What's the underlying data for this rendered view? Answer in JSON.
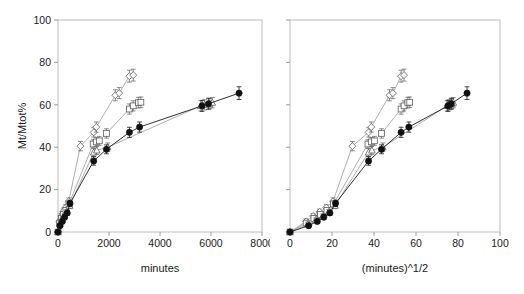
{
  "figure": {
    "background_color": "#ffffff",
    "panel_count": 2
  },
  "chart_data": [
    {
      "type": "scatter",
      "panel": "left",
      "title": "",
      "xlabel": "minutes",
      "ylabel": "Mt/Mtot%",
      "xlim": [
        0,
        8000
      ],
      "ylim": [
        0,
        100
      ],
      "xticks": [
        0,
        2000,
        4000,
        6000,
        8000
      ],
      "yticks": [
        0,
        20,
        40,
        60,
        80,
        100
      ],
      "xtick_labels": [
        "0",
        "2000",
        "4000",
        "6000",
        "8000"
      ],
      "ytick_labels": [
        "0",
        "20",
        "40",
        "60",
        "80",
        "100"
      ],
      "grid": false,
      "legend": "none",
      "error_bars": "vertical",
      "series": [
        {
          "name": "open-diamond",
          "marker": "diamond-open",
          "color": "#5d5d5d",
          "x": [
            0,
            60,
            120,
            200,
            300,
            420,
            880,
            1400,
            1500,
            2250,
            2400,
            2800,
            2950
          ],
          "y": [
            0,
            5.0,
            7.5,
            9.5,
            11.5,
            14.5,
            40.5,
            47.0,
            49.5,
            64.5,
            65.5,
            73.5,
            74.0
          ],
          "yerr": [
            0,
            1.2,
            1.2,
            1.3,
            1.4,
            1.6,
            2.2,
            2.2,
            2.4,
            2.6,
            2.6,
            2.8,
            2.8
          ]
        },
        {
          "name": "open-square",
          "marker": "square-open",
          "color": "#5d5d5d",
          "x": [
            0,
            60,
            130,
            210,
            310,
            430,
            1380,
            1500,
            1620,
            1900,
            2800,
            2950,
            3150,
            3250
          ],
          "y": [
            0,
            4.2,
            6.4,
            8.3,
            10.2,
            13.2,
            41.5,
            42.5,
            43.0,
            46.5,
            58.0,
            59.5,
            61.0,
            61.2
          ],
          "yerr": [
            0,
            1.1,
            1.1,
            1.2,
            1.3,
            1.5,
            2.0,
            2.1,
            2.1,
            2.2,
            2.4,
            2.4,
            2.5,
            2.5
          ]
        },
        {
          "name": "open-triangle",
          "marker": "triangle-open",
          "color": "#5d5d5d",
          "x": [
            0,
            70,
            150,
            240,
            340,
            460,
            1400,
            1520,
            1950,
            5600,
            5750,
            5950,
            6050
          ],
          "y": [
            0,
            3.6,
            5.6,
            7.4,
            9.4,
            12.4,
            37.5,
            38.5,
            40.0,
            59.5,
            60.0,
            60.5,
            61.0
          ],
          "yerr": [
            0,
            1.0,
            1.0,
            1.1,
            1.2,
            1.4,
            1.9,
            1.9,
            2.0,
            2.4,
            2.4,
            2.4,
            2.4
          ]
        },
        {
          "name": "filled-circle",
          "marker": "circle-filled",
          "color": "#111111",
          "x": [
            0,
            80,
            170,
            260,
            360,
            470,
            1400,
            1900,
            2800,
            3200,
            5650,
            5900,
            7100
          ],
          "y": [
            0,
            3.0,
            5.0,
            7.0,
            9.0,
            13.5,
            33.5,
            39.0,
            47.0,
            49.5,
            59.5,
            60.5,
            65.5
          ],
          "yerr": [
            0,
            1.0,
            1.0,
            1.1,
            1.2,
            1.5,
            2.0,
            2.1,
            2.4,
            2.4,
            2.6,
            2.6,
            3.0
          ]
        }
      ]
    },
    {
      "type": "scatter",
      "panel": "right",
      "title": "",
      "xlabel": "(minutes)^1/2",
      "ylabel": "",
      "xlim": [
        0,
        100
      ],
      "ylim": [
        0,
        100
      ],
      "xticks": [
        0,
        20,
        40,
        60,
        80,
        100
      ],
      "yticks": [
        0,
        20,
        40,
        60,
        80,
        100
      ],
      "xtick_labels": [
        "0",
        "20",
        "40",
        "60",
        "80",
        "100"
      ],
      "ytick_labels": [
        "",
        "",
        "",
        "",
        "",
        ""
      ],
      "grid": false,
      "legend": "none",
      "error_bars": "vertical",
      "series": [
        {
          "name": "open-diamond",
          "marker": "diamond-open",
          "color": "#5d5d5d",
          "x": [
            0,
            7.7,
            11.0,
            14.1,
            17.3,
            20.5,
            29.7,
            37.4,
            38.7,
            47.4,
            49.0,
            52.9,
            54.3
          ],
          "y": [
            0,
            5.0,
            7.5,
            9.5,
            11.5,
            14.5,
            40.5,
            47.0,
            49.5,
            64.5,
            65.5,
            73.5,
            74.0
          ],
          "yerr": [
            0,
            1.2,
            1.2,
            1.3,
            1.4,
            1.6,
            2.2,
            2.2,
            2.4,
            2.6,
            2.6,
            2.8,
            2.8
          ]
        },
        {
          "name": "open-square",
          "marker": "square-open",
          "color": "#5d5d5d",
          "x": [
            0,
            7.7,
            11.4,
            14.5,
            17.6,
            20.7,
            37.1,
            38.7,
            40.2,
            43.6,
            52.9,
            54.3,
            56.1,
            57.0
          ],
          "y": [
            0,
            4.2,
            6.4,
            8.3,
            10.2,
            13.2,
            41.5,
            42.5,
            43.0,
            46.5,
            58.0,
            59.5,
            61.0,
            61.2
          ],
          "yerr": [
            0,
            1.1,
            1.1,
            1.2,
            1.3,
            1.5,
            2.0,
            2.1,
            2.1,
            2.2,
            2.4,
            2.4,
            2.5,
            2.5
          ]
        },
        {
          "name": "open-triangle",
          "marker": "triangle-open",
          "color": "#5d5d5d",
          "x": [
            0,
            8.4,
            12.2,
            15.5,
            18.4,
            21.4,
            37.4,
            39.0,
            44.2,
            74.8,
            75.8,
            77.1,
            77.8
          ],
          "y": [
            0,
            3.6,
            5.6,
            7.4,
            9.4,
            12.4,
            37.5,
            38.5,
            40.0,
            59.5,
            60.0,
            60.5,
            61.0
          ],
          "yerr": [
            0,
            1.0,
            1.0,
            1.1,
            1.2,
            1.4,
            1.9,
            1.9,
            2.0,
            2.4,
            2.4,
            2.4,
            2.4
          ]
        },
        {
          "name": "filled-circle",
          "marker": "circle-filled",
          "color": "#111111",
          "x": [
            0,
            8.9,
            13.0,
            16.1,
            19.0,
            21.7,
            37.4,
            43.6,
            52.9,
            56.6,
            75.2,
            76.8,
            84.3
          ],
          "y": [
            0,
            3.0,
            5.0,
            7.0,
            9.0,
            13.5,
            33.5,
            39.0,
            47.0,
            49.5,
            59.5,
            60.5,
            65.5
          ],
          "yerr": [
            0,
            1.0,
            1.0,
            1.1,
            1.2,
            1.5,
            2.0,
            2.1,
            2.4,
            2.4,
            2.6,
            2.6,
            3.0
          ]
        }
      ]
    }
  ]
}
